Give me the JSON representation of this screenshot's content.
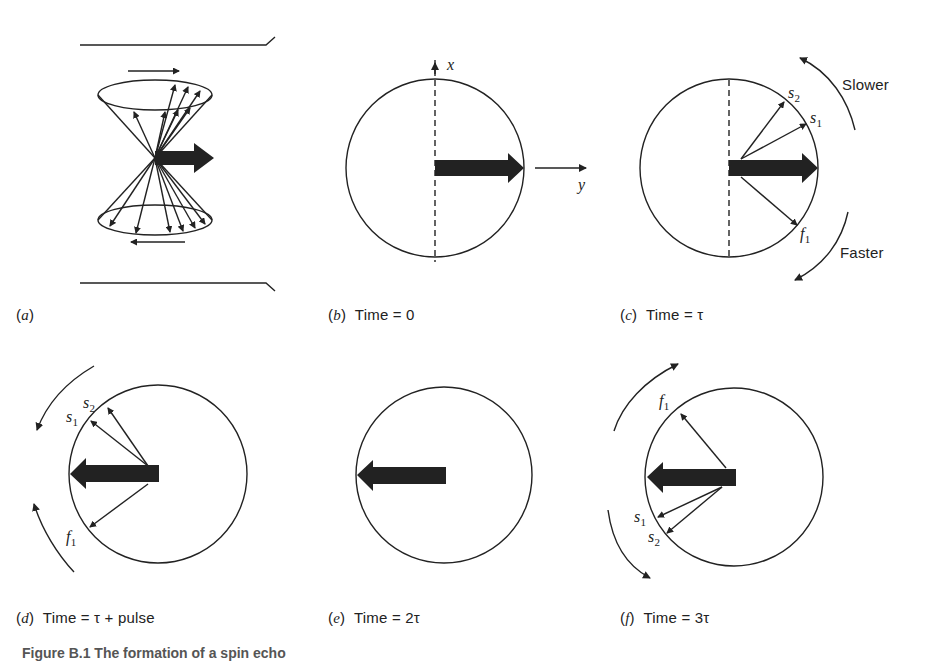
{
  "panels": [
    {
      "id": "a",
      "letter": "a",
      "caption": ""
    },
    {
      "id": "b",
      "letter": "b",
      "caption": "Time = 0"
    },
    {
      "id": "c",
      "letter": "c",
      "caption": "Time = τ"
    },
    {
      "id": "d",
      "letter": "d",
      "caption": "Time = τ + pulse"
    },
    {
      "id": "e",
      "letter": "e",
      "caption": "Time = 2τ"
    },
    {
      "id": "f",
      "letter": "f",
      "caption": "Time = 3τ"
    }
  ],
  "axes": {
    "x": "x",
    "y": "y"
  },
  "vector_labels": {
    "s1": "s",
    "s2": "s",
    "f1": "f",
    "sub1": "1",
    "sub2": "2"
  },
  "annotations": {
    "slower": "Slower",
    "faster": "Faster"
  },
  "figure_caption": "Figure B.1 The formation of a spin echo"
}
